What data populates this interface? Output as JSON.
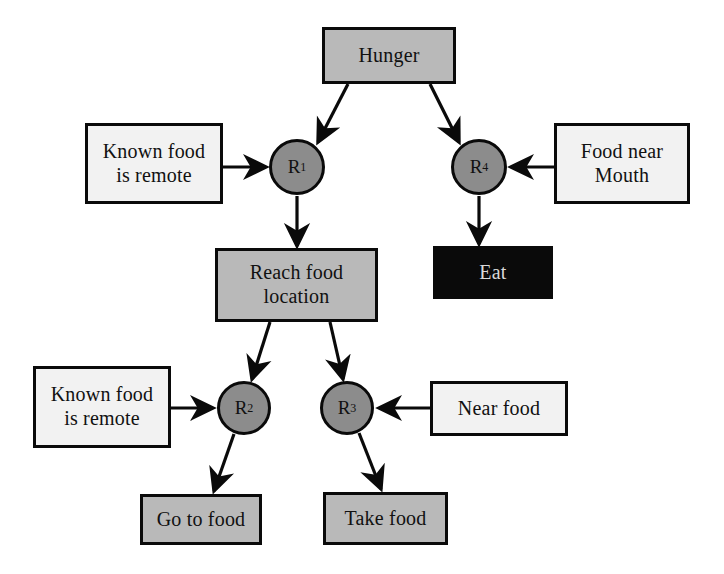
{
  "diagram": {
    "colors": {
      "background": "#ffffff",
      "stroke": "#0a0a0a",
      "box_gray": "#b9b9b9",
      "box_light": "#f2f2f2",
      "box_dark": "#0a0a0a",
      "dark_text": "#d9d9d9",
      "rule_circle": "#8c8c8c"
    },
    "nodes": [
      {
        "id": "hunger",
        "label": "Hunger",
        "kind": "state",
        "fill": "fill-gray",
        "x": 322,
        "y": 27,
        "w": 134,
        "h": 57
      },
      {
        "id": "known1",
        "label": "Known food\nis remote",
        "kind": "condition",
        "fill": "fill-light",
        "x": 85,
        "y": 123,
        "w": 138,
        "h": 81
      },
      {
        "id": "foodmouth",
        "label": "Food near\nMouth",
        "kind": "condition",
        "fill": "fill-light",
        "x": 554,
        "y": 123,
        "w": 136,
        "h": 81
      },
      {
        "id": "reach",
        "label": "Reach food\nlocation",
        "kind": "state",
        "fill": "fill-gray",
        "x": 215,
        "y": 248,
        "w": 163,
        "h": 74
      },
      {
        "id": "eat",
        "label": "Eat",
        "kind": "action",
        "fill": "fill-dark",
        "x": 433,
        "y": 246,
        "w": 120,
        "h": 53
      },
      {
        "id": "known2",
        "label": "Known food\nis remote",
        "kind": "condition",
        "fill": "fill-light",
        "x": 33,
        "y": 366,
        "w": 138,
        "h": 82
      },
      {
        "id": "nearfood",
        "label": "Near food",
        "kind": "condition",
        "fill": "fill-light",
        "x": 430,
        "y": 381,
        "w": 138,
        "h": 55
      },
      {
        "id": "gotofood",
        "label": "Go to food",
        "kind": "action",
        "fill": "fill-gray",
        "x": 140,
        "y": 494,
        "w": 122,
        "h": 51
      },
      {
        "id": "takefood",
        "label": "Take food",
        "kind": "action",
        "fill": "fill-gray",
        "x": 323,
        "y": 492,
        "w": 125,
        "h": 53
      }
    ],
    "rules": [
      {
        "id": "r1",
        "label": "R",
        "index": "1",
        "cx": 297,
        "cy": 167,
        "r": 28
      },
      {
        "id": "r4",
        "label": "R",
        "index": "4",
        "cx": 479,
        "cy": 167,
        "r": 28
      },
      {
        "id": "r2",
        "label": "R",
        "index": "2",
        "cx": 244,
        "cy": 408,
        "r": 27
      },
      {
        "id": "r3",
        "label": "R",
        "index": "3",
        "cx": 347,
        "cy": 408,
        "r": 27
      }
    ],
    "edges": [
      {
        "id": "hunger-r1",
        "from": "hunger",
        "to": "r1",
        "points": "348,84 318,142"
      },
      {
        "id": "hunger-r4",
        "from": "hunger",
        "to": "r4",
        "points": "430,84 459,142"
      },
      {
        "id": "known1-r1",
        "from": "known1",
        "to": "r1",
        "points": "223,167 266,167"
      },
      {
        "id": "foodmouth-r4",
        "from": "foodmouth",
        "to": "r4",
        "points": "554,167 511,167"
      },
      {
        "id": "r1-reach",
        "from": "r1",
        "to": "reach",
        "points": "297,196 297,246"
      },
      {
        "id": "r4-eat",
        "from": "r4",
        "to": "eat",
        "points": "479,196 479,244"
      },
      {
        "id": "reach-r2",
        "from": "reach",
        "to": "r2",
        "points": "270,322 252,379"
      },
      {
        "id": "reach-r3",
        "from": "reach",
        "to": "r3",
        "points": "330,322 343,379"
      },
      {
        "id": "known2-r2",
        "from": "known2",
        "to": "r2",
        "points": "171,408 213,408"
      },
      {
        "id": "nearfood-r3",
        "from": "nearfood",
        "to": "r3",
        "points": "430,408 379,408"
      },
      {
        "id": "r2-gotofood",
        "from": "r2",
        "to": "gotofood",
        "points": "234,434 214,491"
      },
      {
        "id": "r3-takefood",
        "from": "r3",
        "to": "takefood",
        "points": "359,433 381,489"
      }
    ]
  }
}
